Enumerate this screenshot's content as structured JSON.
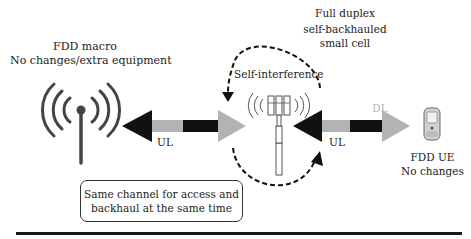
{
  "macro": {
    "title": "FDD macro",
    "subtitle": "No changes/extra equipment",
    "icon": "broadcast-antenna-icon"
  },
  "small_cell": {
    "title_line1": "Full duplex",
    "title_line2": "self-backhauled",
    "title_line3": "small cell",
    "icon": "small-cell-tower-icon"
  },
  "self_interference": {
    "label": "Self-interference"
  },
  "ue": {
    "title": "FDD UE",
    "subtitle": "No changes",
    "icon": "mobile-phone-icon"
  },
  "links": {
    "backhaul": {
      "ul_label": "UL",
      "dl_label": "DL"
    },
    "access": {
      "ul_label": "UL",
      "dl_label": "DL"
    }
  },
  "note": {
    "line1": "Same channel for access and",
    "line2": "backhaul at the same time"
  },
  "colors": {
    "ul_arrow": "#111111",
    "dl_arrow": "#b3b3b3",
    "dashed_loop": "#111111"
  }
}
